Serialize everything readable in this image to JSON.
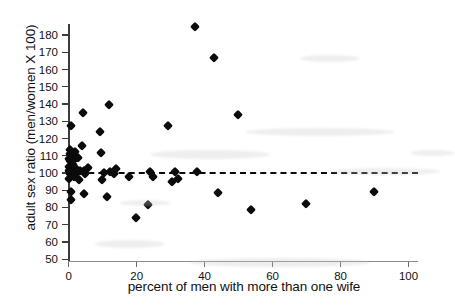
{
  "chart_data": {
    "type": "scatter",
    "title": "",
    "xlabel": "percent of men with more than one wife",
    "ylabel": "adult sex ratio (men/women X 100)",
    "xlim": [
      0,
      103
    ],
    "ylim": [
      48,
      186
    ],
    "xticks": [
      0,
      20,
      40,
      60,
      80,
      100
    ],
    "yticks": [
      50,
      60,
      70,
      80,
      90,
      100,
      110,
      120,
      130,
      140,
      150,
      160,
      170,
      180
    ],
    "grid": false,
    "legend": null,
    "annotations": [
      {
        "name": "reference-line",
        "kind": "horizontal-dashed-line",
        "y": 100,
        "label": "",
        "color": "#0a0a0a"
      }
    ],
    "marker": {
      "shape": "diamond",
      "color": "#0b0b0b",
      "size": 7
    },
    "points": [
      {
        "x": 0.2,
        "y": 96.0
      },
      {
        "x": 0.3,
        "y": 100.5
      },
      {
        "x": 0.4,
        "y": 103.0
      },
      {
        "x": 0.4,
        "y": 108.0
      },
      {
        "x": 0.5,
        "y": 110.5
      },
      {
        "x": 0.5,
        "y": 113.0
      },
      {
        "x": 0.6,
        "y": 106.5
      },
      {
        "x": 0.6,
        "y": 99.0
      },
      {
        "x": 0.7,
        "y": 101.5
      },
      {
        "x": 0.8,
        "y": 88.5
      },
      {
        "x": 0.9,
        "y": 84.0
      },
      {
        "x": 1.0,
        "y": 127.0
      },
      {
        "x": 1.2,
        "y": 110.0
      },
      {
        "x": 1.4,
        "y": 104.0
      },
      {
        "x": 1.5,
        "y": 100.0
      },
      {
        "x": 1.8,
        "y": 97.0
      },
      {
        "x": 2.0,
        "y": 107.5
      },
      {
        "x": 2.2,
        "y": 112.0
      },
      {
        "x": 2.4,
        "y": 102.0
      },
      {
        "x": 2.6,
        "y": 99.5
      },
      {
        "x": 3.0,
        "y": 108.5
      },
      {
        "x": 3.2,
        "y": 95.5
      },
      {
        "x": 3.5,
        "y": 101.0
      },
      {
        "x": 4.0,
        "y": 115.5
      },
      {
        "x": 4.4,
        "y": 134.5
      },
      {
        "x": 4.6,
        "y": 100.5
      },
      {
        "x": 4.8,
        "y": 87.5
      },
      {
        "x": 5.0,
        "y": 99.0
      },
      {
        "x": 6.0,
        "y": 102.5
      },
      {
        "x": 9.5,
        "y": 123.5
      },
      {
        "x": 9.8,
        "y": 111.0
      },
      {
        "x": 10.0,
        "y": 95.8
      },
      {
        "x": 10.5,
        "y": 99.5
      },
      {
        "x": 11.5,
        "y": 85.5
      },
      {
        "x": 12.0,
        "y": 139.0
      },
      {
        "x": 12.5,
        "y": 100.0
      },
      {
        "x": 13.5,
        "y": 99.0
      },
      {
        "x": 14.0,
        "y": 102.0
      },
      {
        "x": 18.0,
        "y": 97.5
      },
      {
        "x": 20.0,
        "y": 73.3
      },
      {
        "x": 23.5,
        "y": 81.0
      },
      {
        "x": 24.0,
        "y": 100.0
      },
      {
        "x": 25.0,
        "y": 97.0
      },
      {
        "x": 29.5,
        "y": 127.0
      },
      {
        "x": 30.5,
        "y": 94.5
      },
      {
        "x": 31.5,
        "y": 100.0
      },
      {
        "x": 32.5,
        "y": 96.0
      },
      {
        "x": 37.5,
        "y": 184.5
      },
      {
        "x": 38.0,
        "y": 100.0
      },
      {
        "x": 43.0,
        "y": 166.5
      },
      {
        "x": 44.0,
        "y": 88.0
      },
      {
        "x": 50.0,
        "y": 133.5
      },
      {
        "x": 54.0,
        "y": 78.0
      },
      {
        "x": 70.0,
        "y": 81.8
      },
      {
        "x": 90.0,
        "y": 88.5
      }
    ]
  }
}
